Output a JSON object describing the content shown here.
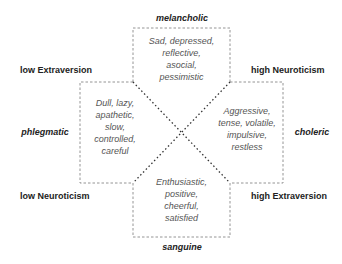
{
  "diagram": {
    "type": "temperament-quadrant",
    "temperaments": {
      "top": {
        "name": "melancholic",
        "traits": [
          "Sad, depressed,",
          "reflective,",
          "asocial,",
          "pessimistic"
        ]
      },
      "left": {
        "name": "phlegmatic",
        "traits": [
          "Dull, lazy,",
          "apathetic,",
          "slow,",
          "controlled,",
          "careful"
        ]
      },
      "right": {
        "name": "choleric",
        "traits": [
          "Aggressive,",
          "tense, volatile,",
          "impulsive,",
          "restless"
        ]
      },
      "bottom": {
        "name": "sanguine",
        "traits": [
          "Enthusiastic,",
          "positive,",
          "cheerful,",
          "satisfied"
        ]
      }
    },
    "axes": {
      "top_left": "low Extraversion",
      "top_right": "high Neuroticism",
      "bottom_left": "low Neuroticism",
      "bottom_right": "high Extraversion"
    },
    "colors": {
      "line": "#777777",
      "label": "#222222",
      "traits": "#555555"
    }
  }
}
